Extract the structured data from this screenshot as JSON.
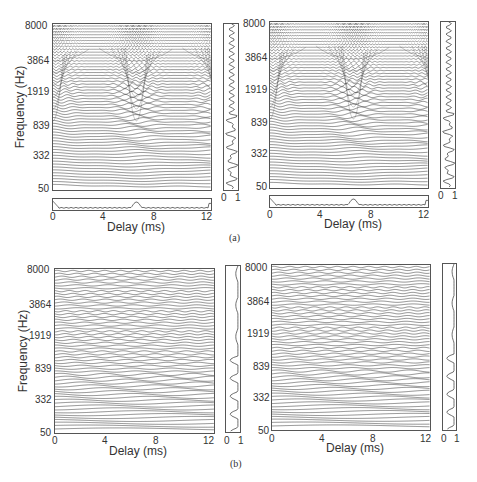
{
  "chart_data": [
    {
      "id": "a-left",
      "type": "line",
      "description": "Correlogram: stacked autocorrelation functions per frequency channel",
      "xlabel": "Delay (ms)",
      "ylabel": "Frequency (Hz)",
      "xticks": [
        "0",
        "4",
        "8",
        "12"
      ],
      "yticks": [
        "50",
        "332",
        "839",
        "1919",
        "3864",
        "8000"
      ],
      "xlim": [
        0,
        12.5
      ],
      "side_panel_xticks": [
        "0",
        "1"
      ],
      "summary_peak_delay_ms": 6.6
    },
    {
      "id": "a-right",
      "type": "line",
      "xlabel": "Delay (ms)",
      "ylabel": "",
      "xticks": [
        "0",
        "4",
        "8",
        "12"
      ],
      "yticks": [
        "50",
        "332",
        "839",
        "1919",
        "3864",
        "8000"
      ],
      "xlim": [
        0,
        12.5
      ],
      "side_panel_xticks": [
        "0",
        "1"
      ],
      "summary_peak_delay_ms": 6.6
    },
    {
      "id": "b-left",
      "type": "line",
      "xlabel": "Delay (ms)",
      "ylabel": "Frequency (Hz)",
      "xticks": [
        "0",
        "4",
        "8",
        "12"
      ],
      "yticks": [
        "50",
        "332",
        "839",
        "1919",
        "3864",
        "8000"
      ],
      "xlim": [
        0,
        12.5
      ],
      "side_panel_xticks": [
        "0",
        "1"
      ]
    },
    {
      "id": "b-right",
      "type": "line",
      "xlabel": "Delay (ms)",
      "ylabel": "",
      "xticks": [
        "0",
        "4",
        "8",
        "12"
      ],
      "yticks": [
        "50",
        "332",
        "839",
        "1919",
        "3864",
        "8000"
      ],
      "xlim": [
        0,
        12.5
      ],
      "side_panel_xticks": [
        "0",
        "1"
      ]
    }
  ],
  "labels": {
    "xlabel": "Delay (ms)",
    "ylabel": "Frequency (Hz)",
    "xticks": [
      "0",
      "4",
      "8",
      "12"
    ],
    "yticks": [
      "8000",
      "3864",
      "1919",
      "839",
      "332",
      "50"
    ],
    "side_ticks": [
      "0",
      "1"
    ],
    "caption_a": "(a)",
    "caption_b": "(b)"
  },
  "colors": {
    "line": "#333333",
    "frame": "#555555",
    "background": "#ffffff"
  }
}
